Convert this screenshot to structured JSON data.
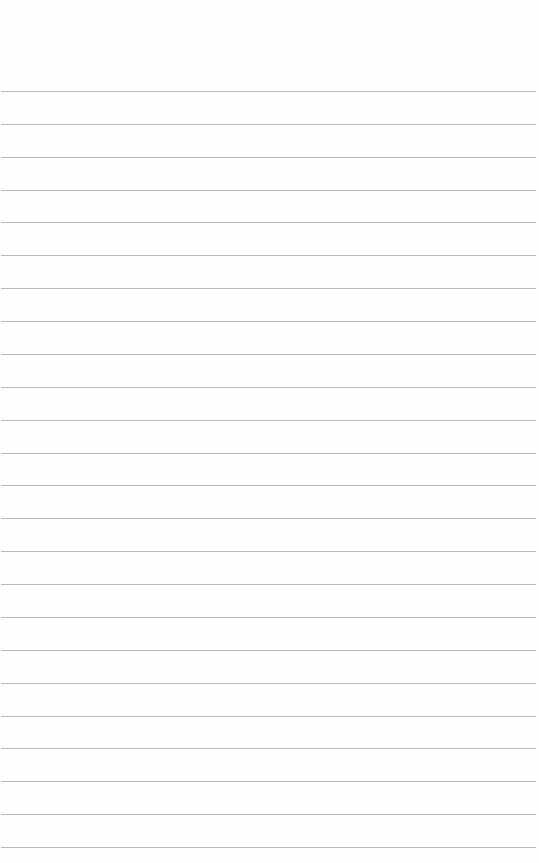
{
  "paper": {
    "type": "lined-paper",
    "background_color": "#fefefe",
    "line_color": "#b9b9b9",
    "line_count": 24,
    "first_line_y": 91,
    "line_spacing": 32.87,
    "line_left": 1,
    "line_width": 535
  }
}
